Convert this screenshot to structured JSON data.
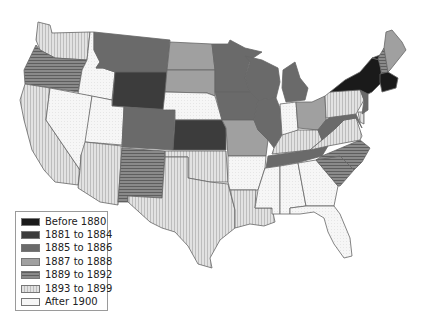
{
  "legend": {
    "items": [
      {
        "label": "Before 1880",
        "fill": "#1a1a1a",
        "pattern": "solid"
      },
      {
        "label": "1881 to 1884",
        "fill": "#3c3c3c",
        "pattern": "solid"
      },
      {
        "label": "1885 to 1886",
        "fill": "#6a6a6a",
        "pattern": "solid"
      },
      {
        "label": "1887 to 1888",
        "fill": "#a0a0a0",
        "pattern": "solid"
      },
      {
        "label": "1889 to 1892",
        "fill": "#8a8a8a",
        "pattern": "horizontal-stripes"
      },
      {
        "label": "1893 to 1899",
        "fill": "#d8d8d8",
        "pattern": "vertical-stripes"
      },
      {
        "label": "After 1900",
        "fill": "#f4f4f4",
        "pattern": "dotted"
      }
    ]
  },
  "map": {
    "region": "Contiguous United States",
    "states": [
      {
        "name": "WA",
        "category": "1893 to 1899"
      },
      {
        "name": "OR",
        "category": "1889 to 1892"
      },
      {
        "name": "CA",
        "category": "1893 to 1899"
      },
      {
        "name": "ID",
        "category": "After 1900"
      },
      {
        "name": "NV",
        "category": "After 1900"
      },
      {
        "name": "MT",
        "category": "1885 to 1886"
      },
      {
        "name": "WY",
        "category": "1881 to 1884"
      },
      {
        "name": "UT",
        "category": "After 1900"
      },
      {
        "name": "AZ",
        "category": "1893 to 1899"
      },
      {
        "name": "CO",
        "category": "1885 to 1886"
      },
      {
        "name": "NM",
        "category": "1889 to 1892"
      },
      {
        "name": "ND",
        "category": "1887 to 1888"
      },
      {
        "name": "SD",
        "category": "1887 to 1888"
      },
      {
        "name": "NE",
        "category": "After 1900"
      },
      {
        "name": "KS",
        "category": "1881 to 1884"
      },
      {
        "name": "OK",
        "category": "1893 to 1899"
      },
      {
        "name": "TX",
        "category": "1893 to 1899"
      },
      {
        "name": "MN",
        "category": "1885 to 1886"
      },
      {
        "name": "IA",
        "category": "1885 to 1886"
      },
      {
        "name": "MO",
        "category": "1887 to 1888"
      },
      {
        "name": "AR",
        "category": "After 1900"
      },
      {
        "name": "LA",
        "category": "1893 to 1899"
      },
      {
        "name": "WI",
        "category": "1885 to 1886"
      },
      {
        "name": "IL",
        "category": "1885 to 1886"
      },
      {
        "name": "MI",
        "category": "1885 to 1886"
      },
      {
        "name": "IN",
        "category": "After 1900"
      },
      {
        "name": "OH",
        "category": "1887 to 1888"
      },
      {
        "name": "KY",
        "category": "1893 to 1899"
      },
      {
        "name": "TN",
        "category": "1885 to 1886"
      },
      {
        "name": "MS",
        "category": "After 1900"
      },
      {
        "name": "AL",
        "category": "After 1900"
      },
      {
        "name": "GA",
        "category": "After 1900"
      },
      {
        "name": "FL",
        "category": "After 1900"
      },
      {
        "name": "SC",
        "category": "1889 to 1892"
      },
      {
        "name": "NC",
        "category": "1889 to 1892"
      },
      {
        "name": "VA",
        "category": "1893 to 1899"
      },
      {
        "name": "WV",
        "category": "1885 to 1886"
      },
      {
        "name": "MD",
        "category": "1885 to 1886"
      },
      {
        "name": "DE",
        "category": "1893 to 1899"
      },
      {
        "name": "PA",
        "category": "1893 to 1899"
      },
      {
        "name": "NJ",
        "category": "1885 to 1886"
      },
      {
        "name": "NY",
        "category": "Before 1880"
      },
      {
        "name": "CT",
        "category": "Before 1880"
      },
      {
        "name": "RI",
        "category": "Before 1880"
      },
      {
        "name": "MA",
        "category": "Before 1880"
      },
      {
        "name": "VT",
        "category": "Before 1880"
      },
      {
        "name": "NH",
        "category": "1889 to 1892"
      },
      {
        "name": "ME",
        "category": "1887 to 1888"
      }
    ]
  }
}
